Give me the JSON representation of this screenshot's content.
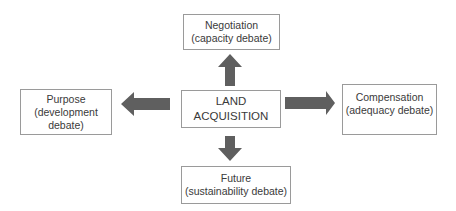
{
  "diagram": {
    "center": {
      "lines": [
        "LAND",
        "ACQUISITION"
      ]
    },
    "top": {
      "lines": [
        "Negotiation",
        "(capacity debate)"
      ]
    },
    "left": {
      "lines": [
        "Purpose",
        "(development",
        "debate)"
      ]
    },
    "right": {
      "lines": [
        "Compensation",
        "(adequacy debate)"
      ]
    },
    "bottom": {
      "lines": [
        "Future",
        "(sustainability debate)"
      ]
    },
    "arrow_color": "#5f5f5f",
    "border_color": "#9a9a9a"
  }
}
